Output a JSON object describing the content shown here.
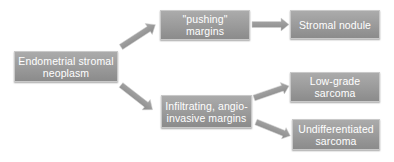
{
  "diagram": {
    "type": "flowchart",
    "nodes": [
      {
        "id": "root",
        "label": "Endometrial stromal\nneoplasm"
      },
      {
        "id": "pushing",
        "label": "\"pushing\"\nmargins"
      },
      {
        "id": "stromal",
        "label": "Stromal nodule"
      },
      {
        "id": "infiltrating",
        "label": "Infiltrating, angio-\ninvasive margins"
      },
      {
        "id": "lowgrade",
        "label": "Low-grade\nsarcoma"
      },
      {
        "id": "undiff",
        "label": "Undifferentiated\nsarcoma"
      }
    ],
    "edges": [
      {
        "from": "root",
        "to": "pushing"
      },
      {
        "from": "root",
        "to": "infiltrating"
      },
      {
        "from": "pushing",
        "to": "stromal"
      },
      {
        "from": "infiltrating",
        "to": "lowgrade"
      },
      {
        "from": "infiltrating",
        "to": "undiff"
      }
    ],
    "colors": {
      "box_top": "#ababab",
      "box_bottom": "#8b8b8b",
      "box_text": "#ffffff",
      "arrow": "#9a9a9a",
      "background": "#ffffff"
    }
  }
}
